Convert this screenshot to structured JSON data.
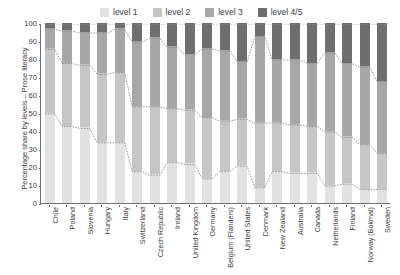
{
  "legend": {
    "position": "top",
    "items": [
      {
        "label": "level 1",
        "color": "#e2e2e2"
      },
      {
        "label": "level 2",
        "color": "#c6c6c6"
      },
      {
        "label": "level 3",
        "color": "#a7a7a7"
      },
      {
        "label": "level 4/5",
        "color": "#6e6e6e"
      }
    ]
  },
  "axes": {
    "ylabel": "Percentage share by levels – Prose literacy",
    "xlabel": "",
    "yticks": [
      0,
      10,
      20,
      30,
      40,
      50,
      60,
      70,
      80,
      90,
      100
    ],
    "ylim": [
      0,
      100
    ]
  },
  "chart_data": {
    "type": "bar",
    "stacked": true,
    "title": "",
    "xlabel": "",
    "ylabel": "Percentage share by levels – Prose literacy",
    "ylim": [
      0,
      100
    ],
    "grid": false,
    "legend_position": "top",
    "categories": [
      "Chile",
      "Poland",
      "Slovenia",
      "Hungary",
      "Italy",
      "Switzerland",
      "Czech Republic",
      "Ireland",
      "United Kingdom",
      "Germany",
      "Belgium (Flanders)",
      "United States",
      "Denmark",
      "New Zealand",
      "Australia",
      "Canada",
      "Netherlands",
      "Finland",
      "Norway (Bokmal)",
      "Sweden"
    ],
    "series": [
      {
        "name": "level 1",
        "color": "#e2e2e2",
        "values": [
          50,
          43,
          42,
          34,
          34,
          18,
          16,
          23,
          22,
          14,
          18,
          21,
          9,
          18,
          17,
          17,
          10,
          11,
          8,
          8
        ]
      },
      {
        "name": "level 2",
        "color": "#c6c6c6",
        "values": [
          36,
          35,
          35,
          38,
          39,
          36,
          38,
          30,
          30,
          34,
          28,
          26,
          36,
          27,
          27,
          26,
          30,
          26,
          25,
          20
        ]
      },
      {
        "name": "level 3",
        "color": "#a7a7a7",
        "values": [
          11,
          18,
          18,
          23,
          24,
          36,
          38,
          34,
          31,
          38,
          39,
          32,
          48,
          35,
          36,
          35,
          44,
          41,
          43,
          40
        ]
      },
      {
        "name": "level 4/5",
        "color": "#6e6e6e",
        "values": [
          3,
          4,
          5,
          5,
          3,
          10,
          8,
          13,
          17,
          14,
          15,
          21,
          7,
          20,
          20,
          22,
          16,
          22,
          24,
          32
        ]
      }
    ],
    "cumulative_boundaries": {
      "note": "dotted connector lines trace cumulative tops between bars",
      "level1_top": [
        50,
        43,
        42,
        34,
        34,
        18,
        16,
        23,
        22,
        14,
        18,
        21,
        9,
        18,
        17,
        17,
        10,
        11,
        8,
        8
      ],
      "level2_top": [
        86,
        78,
        77,
        72,
        73,
        54,
        54,
        53,
        52,
        48,
        46,
        47,
        45,
        45,
        44,
        43,
        40,
        37,
        33,
        28
      ],
      "level3_top": [
        97,
        96,
        95,
        95,
        97,
        90,
        92,
        87,
        83,
        86,
        85,
        79,
        93,
        80,
        80,
        78,
        84,
        78,
        76,
        68
      ],
      "level4_top": [
        100,
        100,
        100,
        100,
        100,
        100,
        100,
        100,
        100,
        100,
        100,
        100,
        100,
        100,
        100,
        100,
        100,
        100,
        100,
        100
      ]
    }
  }
}
